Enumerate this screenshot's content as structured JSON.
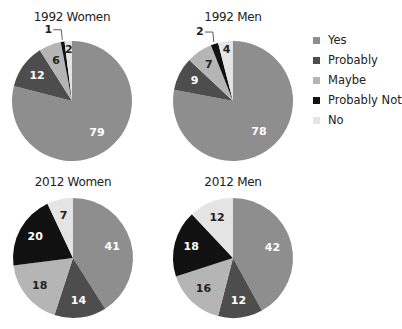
{
  "colors": {
    "Yes": "#8e8e8e",
    "Probably": "#4d4d4d",
    "Maybe": "#b5b5b5",
    "Probably Not": "#111111",
    "No": "#e4e4e4"
  },
  "legend": {
    "items": [
      {
        "label": "Yes",
        "color": "#8e8e8e"
      },
      {
        "label": "Probably",
        "color": "#4d4d4d"
      },
      {
        "label": "Maybe",
        "color": "#b5b5b5"
      },
      {
        "label": "Probably Not",
        "color": "#111111"
      },
      {
        "label": "No",
        "color": "#e4e4e4"
      }
    ]
  },
  "chart_data": [
    {
      "type": "pie",
      "title": "1992 Women",
      "categories": [
        "Yes",
        "Probably",
        "Maybe",
        "Probably Not",
        "No"
      ],
      "values": [
        79,
        12,
        6,
        1,
        2
      ],
      "legend_position": "right"
    },
    {
      "type": "pie",
      "title": "1992 Men",
      "categories": [
        "Yes",
        "Probably",
        "Maybe",
        "Probably Not",
        "No"
      ],
      "values": [
        78,
        9,
        7,
        2,
        4
      ],
      "legend_position": "right"
    },
    {
      "type": "pie",
      "title": "2012 Women",
      "categories": [
        "Yes",
        "Probably",
        "Maybe",
        "Probably Not",
        "No"
      ],
      "values": [
        41,
        14,
        18,
        20,
        7
      ],
      "legend_position": "right"
    },
    {
      "type": "pie",
      "title": "2012 Men",
      "categories": [
        "Yes",
        "Probably",
        "Maybe",
        "Probably Not",
        "No"
      ],
      "values": [
        42,
        12,
        16,
        18,
        12
      ],
      "legend_position": "right"
    }
  ]
}
